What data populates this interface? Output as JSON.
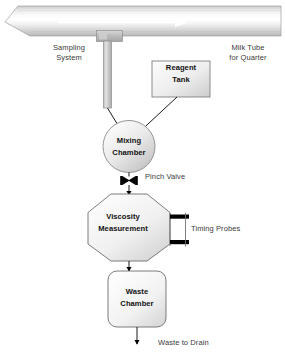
{
  "diagram": {
    "type": "process-flow-diagram",
    "background_color": "#ffffff",
    "line_color": "#000000",
    "label_color": "#3a3a3a",
    "node_text_color": "#111111",
    "node_fill_light": "#fdfdfd",
    "node_fill_dark": "#c9c9c9",
    "tube_highlight": "#ffffff",
    "tube_shade": "#b4b4b4",
    "probe_color": "#000000"
  },
  "labels": {
    "sampling_system": "Sampling\nSystem",
    "milk_tube": "Milk Tube\nfor Quarter",
    "pinch_valve": "Pinch Valve",
    "timing_probes": "Timing Probes",
    "waste_to_drain": "Waste to Drain"
  },
  "nodes": {
    "reagent_tank": "Reagent\nTank",
    "mixing_chamber": "Mixing\nChamber",
    "viscosity_measurement": "Viscosity\nMeasurement",
    "waste_chamber": "Waste\nChamber"
  },
  "flow": {
    "tube_direction": "left-to-right",
    "steps": [
      "Milk Tube for Quarter",
      "Sampling System",
      "Mixing Chamber",
      "Pinch Valve",
      "Viscosity Measurement",
      "Waste Chamber",
      "Waste to Drain"
    ]
  }
}
